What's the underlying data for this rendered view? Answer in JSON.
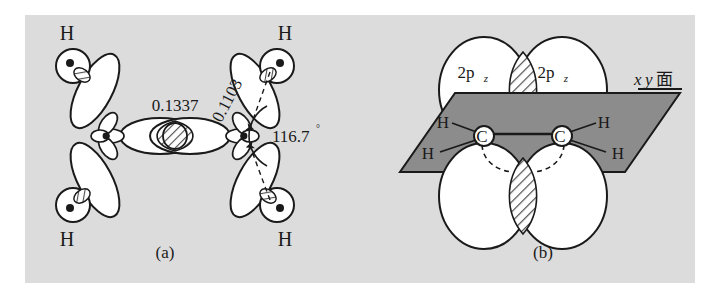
{
  "figure": {
    "background_color": "#ffffff",
    "panel_color": "#dcdcdc",
    "ink_color": "#1a1a1a",
    "plane_fill_color": "#8c8c8c",
    "lobe_fill_color": "#ffffff",
    "hatch_color": "#4d4d4d"
  },
  "panel_a": {
    "caption": "(a)",
    "bond_length_cc": "0.1337",
    "bond_length_ch": "0.1103",
    "bond_angle": "116.7",
    "degree_symbol": "°",
    "hydrogen_labels": [
      {
        "id": "h-top-left",
        "text": "H"
      },
      {
        "id": "h-bottom-left",
        "text": "H"
      },
      {
        "id": "h-top-right",
        "text": "H"
      },
      {
        "id": "h-bottom-right",
        "text": "H"
      }
    ]
  },
  "panel_b": {
    "caption": "(b)",
    "orbital_labels": [
      {
        "id": "orbital-left",
        "base": "2p",
        "subscript": "z"
      },
      {
        "id": "orbital-right",
        "base": "2p",
        "subscript": "z"
      }
    ],
    "plane_label": {
      "x": "x",
      "y": "y",
      "kanji": "面"
    },
    "carbon_labels": [
      {
        "id": "carbon-left",
        "text": "C"
      },
      {
        "id": "carbon-right",
        "text": "C"
      }
    ],
    "hydrogen_labels": [
      {
        "id": "h-left-upper",
        "text": "H"
      },
      {
        "id": "h-left-lower",
        "text": "H"
      },
      {
        "id": "h-right-upper",
        "text": "H"
      },
      {
        "id": "h-right-lower",
        "text": "H"
      }
    ]
  }
}
